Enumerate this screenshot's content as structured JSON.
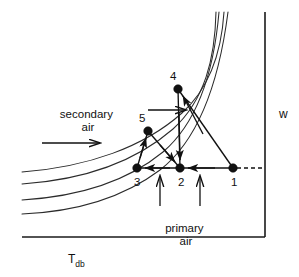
{
  "figure": {
    "type": "psychrometric-process-diagram",
    "background_color": "#ffffff",
    "line_color": "#111111",
    "curve_color": "#2b2b2b"
  },
  "axes": {
    "x_axis_label": "T",
    "x_axis_label_sub": "db",
    "y_axis_label": "w",
    "x_axis": {
      "x1": 22,
      "y1": 237,
      "x2": 265,
      "y2": 237
    },
    "y_axis": {
      "x1": 265,
      "y1": 12,
      "x2": 265,
      "y2": 237
    }
  },
  "annotations": {
    "primary_air_line1": "primary",
    "primary_air_line2": "air",
    "secondary_air_line1": "secondary",
    "secondary_air_line2": "air"
  },
  "chart_data": {
    "type": "scatter",
    "title": "",
    "xlabel": "Tdb",
    "ylabel": "w",
    "grid": false,
    "legend": "none",
    "points": [
      {
        "label": "1",
        "x": 233,
        "y": 168,
        "label_x": 231,
        "label_y": 186
      },
      {
        "label": "2",
        "x": 180,
        "y": 168,
        "label_x": 178,
        "label_y": 186
      },
      {
        "label": "3",
        "x": 137,
        "y": 168,
        "label_x": 134,
        "label_y": 186
      },
      {
        "label": "4",
        "x": 178,
        "y": 89,
        "label_x": 170,
        "label_y": 80
      },
      {
        "label": "5",
        "x": 148,
        "y": 131,
        "label_x": 139,
        "label_y": 122
      }
    ],
    "rh_curves": [
      {
        "name": "rh-curve-1",
        "path": "M 22,214 C 70,212 120,200 160,170 C 196,142 218,90 228,12"
      },
      {
        "name": "rh-curve-2",
        "path": "M 22,200 C 72,197 124,184 163,152 C 198,122 214,70 219,12"
      },
      {
        "name": "rh-curve-3",
        "path": "M 22,184 C 80,180 134,163 173,129 C 205,100 215,58 216,12"
      },
      {
        "name": "rh-curve-4",
        "path": "M 22,172 C 88,167 144,147 182,113 C 214,84 222,44 224,12"
      }
    ],
    "process_lines": [
      {
        "name": "line-1-to-2",
        "x1": 233,
        "y1": 168,
        "x2": 180,
        "y2": 168
      },
      {
        "name": "line-2-to-3",
        "x1": 180,
        "y1": 168,
        "x2": 137,
        "y2": 168
      },
      {
        "name": "line-1-to-4",
        "x1": 233,
        "y1": 168,
        "x2": 178,
        "y2": 89
      },
      {
        "name": "line-4-to-2",
        "x1": 178,
        "y1": 89,
        "x2": 180,
        "y2": 168
      },
      {
        "name": "line-3-to-5",
        "x1": 137,
        "y1": 168,
        "x2": 148,
        "y2": 131
      },
      {
        "name": "line-5-to-2",
        "x1": 148,
        "y1": 131,
        "x2": 180,
        "y2": 168
      }
    ],
    "dashed_line": {
      "name": "dashed-1-to-axis",
      "x1": 237,
      "y1": 168,
      "x2": 265,
      "y2": 168
    },
    "annotation_arrows": [
      {
        "name": "arrow-primary-left",
        "x1": 160,
        "y1": 206,
        "x2": 160,
        "y2": 176,
        "direction": "up"
      },
      {
        "name": "arrow-primary-right",
        "x1": 200,
        "y1": 206,
        "x2": 200,
        "y2": 176,
        "direction": "up"
      },
      {
        "name": "arrow-secondary-upper",
        "x1": 148,
        "y1": 110,
        "x2": 186,
        "y2": 110,
        "direction": "right"
      },
      {
        "name": "arrow-secondary-lower",
        "x1": 42,
        "y1": 143,
        "x2": 100,
        "y2": 143,
        "direction": "right"
      }
    ]
  },
  "label_positions": {
    "secondary_air_x": 88,
    "secondary_air_y": 118,
    "primary_air_x": 186,
    "primary_air_y": 232,
    "x_axis_label_x": 68,
    "x_axis_label_y": 263,
    "y_axis_label_x": 279,
    "y_axis_label_y": 118
  }
}
